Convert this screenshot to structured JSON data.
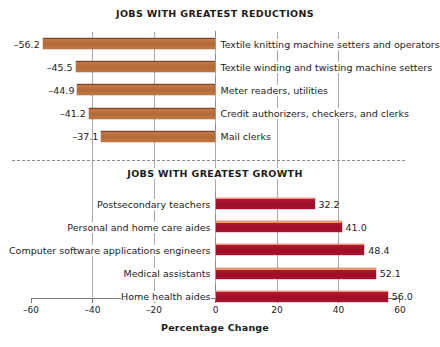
{
  "chart_data": {
    "type": "bar",
    "orientation": "horizontal",
    "xlabel": "Percentage Change",
    "ylabel": "",
    "xlim": [
      -60,
      60
    ],
    "xticks": [
      -60,
      -40,
      -20,
      0,
      20,
      40,
      60
    ],
    "xtick_labels": [
      "–60",
      "–40",
      "–20",
      "0",
      "20",
      "40",
      "60"
    ],
    "grid": true,
    "gridlines_at": [
      -40,
      -20,
      0,
      20,
      40
    ],
    "legend": "none",
    "panels": [
      {
        "title": "JOBS WITH GREATEST REDUCTIONS",
        "color": "#b56a38",
        "label_side": "right",
        "value_side": "left",
        "categories": [
          "Textile knitting machine setters and operators",
          "Textile winding and twisting machine setters",
          "Meter readers, utilities",
          "Credit authorizers, checkers, and clerks",
          "Mail clerks"
        ],
        "values": [
          -56.2,
          -45.5,
          -44.9,
          -41.2,
          -37.1
        ],
        "value_labels": [
          "–56.2",
          "–45.5",
          "–44.9",
          "–41.2",
          "–37.1"
        ]
      },
      {
        "title": "JOBS WITH GREATEST GROWTH",
        "color": "#a51230",
        "label_side": "left",
        "value_side": "right",
        "categories": [
          "Postsecondary teachers",
          "Personal and home care aides",
          "Computer software applications engineers",
          "Medical assistants",
          "Home health aides"
        ],
        "values": [
          32.2,
          41.0,
          48.4,
          52.1,
          56.0
        ],
        "value_labels": [
          "32.2",
          "41.0",
          "48.4",
          "52.1",
          "56.0"
        ]
      }
    ]
  },
  "colors": {
    "bar_negative": "#b56a38",
    "bar_negative_top": "#7a4527",
    "bar_positive": "#a51230",
    "bar_positive_top": "#e8986a",
    "gridline": "#aaaaaa",
    "axis": "#7a7a7a",
    "separator": "#8d8d8d",
    "text": "#1c1c1c",
    "background": "#ffffff"
  }
}
